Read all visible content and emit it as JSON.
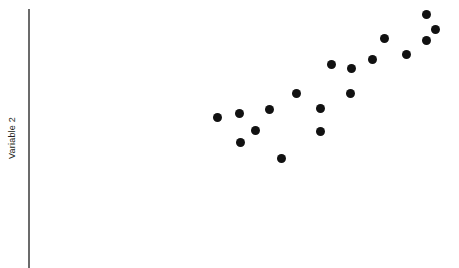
{
  "figure": {
    "width": 459,
    "height": 268,
    "background": "#ffffff"
  },
  "axis": {
    "y_label": "Variable 2",
    "y_label_color": "#231f20",
    "line_color": "#6b6b6b",
    "line_x": 28,
    "line_top": 9,
    "line_bottom": 268,
    "line_width": 1.5
  },
  "marker": {
    "color": "#111111",
    "diameter": 9
  },
  "chart_data": {
    "type": "scatter",
    "title": "",
    "xlabel": "",
    "ylabel": "Variable 2",
    "grid": false,
    "legend": null,
    "xlim": [
      0,
      459
    ],
    "ylim": [
      0,
      268
    ],
    "note": "Values are given in pixel coordinates of the plotted points (x right, y down); axes are unlabeled with no tick marks.",
    "series": [
      {
        "name": "points",
        "color": "#111111",
        "points": [
          {
            "x": 217,
            "y": 117
          },
          {
            "x": 239,
            "y": 113
          },
          {
            "x": 240,
            "y": 142
          },
          {
            "x": 255,
            "y": 130
          },
          {
            "x": 269,
            "y": 109
          },
          {
            "x": 281,
            "y": 158
          },
          {
            "x": 296,
            "y": 93
          },
          {
            "x": 320,
            "y": 108
          },
          {
            "x": 320,
            "y": 131
          },
          {
            "x": 331,
            "y": 64
          },
          {
            "x": 350,
            "y": 93
          },
          {
            "x": 351,
            "y": 68
          },
          {
            "x": 372,
            "y": 59
          },
          {
            "x": 384,
            "y": 38
          },
          {
            "x": 406,
            "y": 54
          },
          {
            "x": 426,
            "y": 14
          },
          {
            "x": 426,
            "y": 40
          },
          {
            "x": 435,
            "y": 29
          }
        ]
      }
    ]
  }
}
